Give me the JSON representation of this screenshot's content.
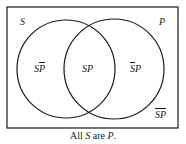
{
  "diagram": {
    "type": "venn",
    "sets": [
      {
        "name": "S",
        "label": "S"
      },
      {
        "name": "P",
        "label": "P"
      }
    ],
    "regions": {
      "s_not_p": {
        "label_base": "S",
        "label_bar": "P",
        "shaded": true,
        "shading": "horizontal-lines"
      },
      "s_and_p": {
        "label": "SP",
        "shaded": false
      },
      "not_s_p": {
        "label_bar": "S",
        "label_base": "P",
        "shaded": false
      },
      "not_s_not_p": {
        "label": "SP",
        "overline_whole": true,
        "shaded": false
      }
    },
    "caption": {
      "prefix": "All ",
      "subject": "S",
      "middle": " are ",
      "predicate": "P",
      "suffix": "."
    },
    "colors": {
      "stroke": "#1a1a1a",
      "hatch": "#8a8a8a",
      "background": "#ffffff"
    }
  }
}
